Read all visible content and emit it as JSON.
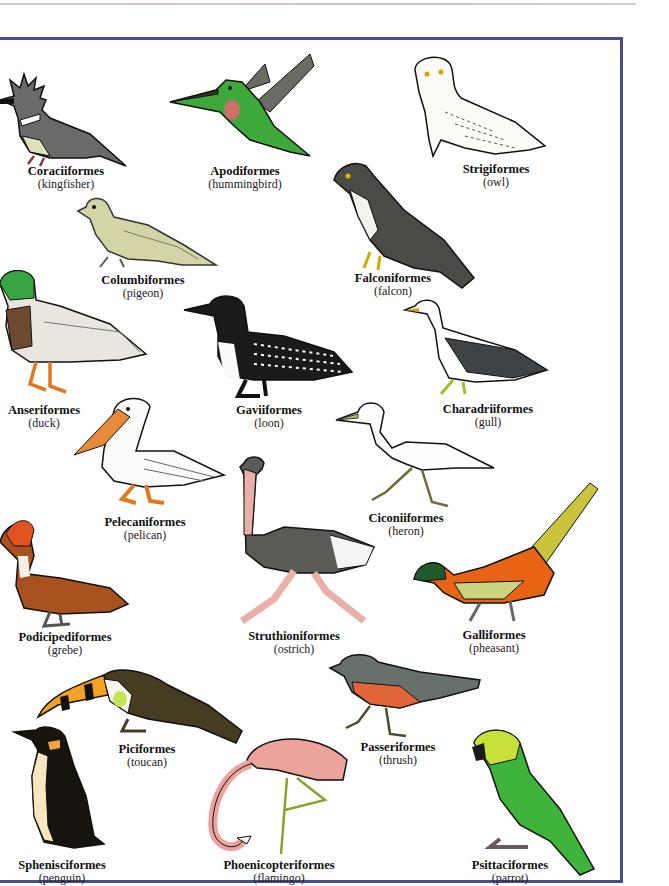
{
  "page": {
    "frame_color": "#4b4a8e",
    "rule_color": "#d8c4cc"
  },
  "birds": [
    {
      "order": "Coraciiformes",
      "common": "(kingfisher)"
    },
    {
      "order": "Apodiformes",
      "common": "(hummingbird)"
    },
    {
      "order": "Strigiformes",
      "common": "(owl)"
    },
    {
      "order": "Columbiformes",
      "common": "(pigeon)"
    },
    {
      "order": "Falconiformes",
      "common": "(falcon)"
    },
    {
      "order": "Anseriformes",
      "common": "(duck)"
    },
    {
      "order": "Gaviiformes",
      "common": "(loon)"
    },
    {
      "order": "Charadriiformes",
      "common": "(gull)"
    },
    {
      "order": "Pelecaniformes",
      "common": "(pelican)"
    },
    {
      "order": "Ciconiiformes",
      "common": "(heron)"
    },
    {
      "order": "Podicipediformes",
      "common": "(grebe)"
    },
    {
      "order": "Struthioniformes",
      "common": "(ostrich)"
    },
    {
      "order": "Galliformes",
      "common": "(pheasant)"
    },
    {
      "order": "Piciformes",
      "common": "(toucan)"
    },
    {
      "order": "Passeriformes",
      "common": "(thrush)"
    },
    {
      "order": "Sphenisciformes",
      "common": "(penguin)"
    },
    {
      "order": "Phoenicopteriformes",
      "common": "(flamingo)"
    },
    {
      "order": "Psittaciformes",
      "common": "(parrot)"
    }
  ]
}
